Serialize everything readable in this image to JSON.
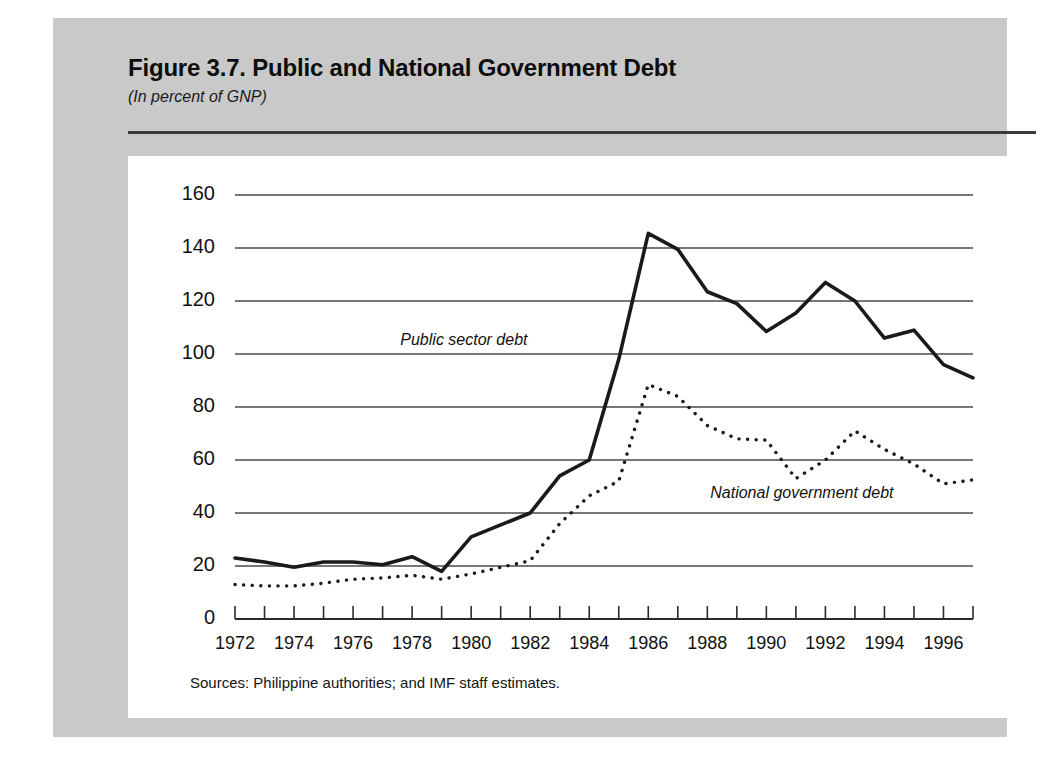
{
  "figure": {
    "title": "Figure 3.7.  Public and National Government Debt",
    "subtitle": "(In percent of GNP)",
    "sources": "Sources:  Philippine authorities; and IMF staff estimates.",
    "panel_color": "#c9c9c9",
    "card_color": "#ffffff",
    "ink_color": "#111111"
  },
  "labels": {
    "public_sector": "Public sector debt",
    "national_government": "National government debt"
  },
  "chart_data": {
    "type": "line",
    "title": "Figure 3.7.  Public and National Government Debt",
    "subtitle": "(In percent of GNP)",
    "xlabel": "",
    "ylabel": "",
    "ylim": [
      0,
      160
    ],
    "xlim": [
      1972,
      1997
    ],
    "yticks": [
      0,
      20,
      40,
      60,
      80,
      100,
      120,
      140,
      160
    ],
    "ytick_labels": [
      "0",
      "20",
      "40",
      "60",
      "80",
      "100",
      "120",
      "140",
      "160"
    ],
    "xticks": [
      1972,
      1973,
      1974,
      1975,
      1976,
      1977,
      1978,
      1979,
      1980,
      1981,
      1982,
      1983,
      1984,
      1985,
      1986,
      1987,
      1988,
      1989,
      1990,
      1991,
      1992,
      1993,
      1994,
      1995,
      1996,
      1997
    ],
    "xtick_labels_shown": [
      "1972",
      "1974",
      "1976",
      "1978",
      "1980",
      "1982",
      "1984",
      "1986",
      "1988",
      "1990",
      "1992",
      "1994",
      "1996"
    ],
    "grid": "horizontal",
    "legend": "inline-annotations",
    "x": [
      1972,
      1973,
      1974,
      1975,
      1976,
      1977,
      1978,
      1979,
      1980,
      1981,
      1982,
      1983,
      1984,
      1985,
      1986,
      1987,
      1988,
      1989,
      1990,
      1991,
      1992,
      1993,
      1994,
      1995,
      1996,
      1997
    ],
    "series": [
      {
        "name": "Public sector debt",
        "style": "solid",
        "color": "#1a1a1a",
        "values": [
          23,
          21.5,
          19.5,
          21.5,
          21.5,
          20.5,
          23.5,
          18,
          31,
          35.5,
          40,
          54,
          60,
          98,
          145.5,
          139.5,
          123.5,
          119,
          108.5,
          115.5,
          127,
          120,
          106,
          109,
          96,
          91
        ]
      },
      {
        "name": "National government debt",
        "style": "dotted",
        "color": "#1a1a1a",
        "values": [
          13,
          12.5,
          12.5,
          13.5,
          15,
          15.5,
          16.5,
          15,
          17,
          19.5,
          22,
          36,
          46.5,
          52,
          88.5,
          84,
          73,
          68,
          67.5,
          53,
          60,
          71,
          64,
          58.5,
          51,
          52.5
        ]
      }
    ]
  }
}
